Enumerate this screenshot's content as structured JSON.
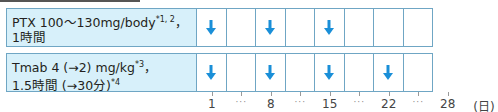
{
  "rows": [
    {
      "label_line1": "PTX 100～130mg/body",
      "label_line1_sup": "*1, 2",
      "label_line1_suffix": "，",
      "label_line2": "1時間",
      "doses": [
        true,
        false,
        true,
        false,
        true,
        false,
        false,
        false
      ]
    },
    {
      "label_line1": "Tmab 4 (→2) mg/kg",
      "label_line1_sup": "*3",
      "label_line1_suffix": "，",
      "label_line2": "1.5時間 (→30分)",
      "label_line2_sup": "*4",
      "doses": [
        true,
        false,
        true,
        false,
        true,
        false,
        true,
        false
      ]
    }
  ],
  "axis": {
    "labels": [
      "1",
      "…",
      "8",
      "…",
      "15",
      "…",
      "22",
      "…",
      "28"
    ],
    "unit": "(日)"
  },
  "colors": {
    "arrow": "#1a8fd8",
    "label_bg": "#d7f0fa",
    "border": "#6fa6c4"
  },
  "icons": {
    "dose": "arrow-down-icon"
  }
}
